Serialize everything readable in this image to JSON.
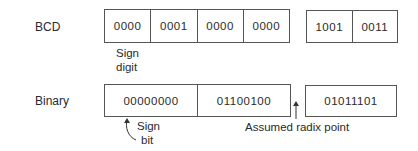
{
  "bcd": {
    "label": "BCD",
    "group1": [
      "0000",
      "0001",
      "0000",
      "0000"
    ],
    "group2": [
      "1001",
      "0011"
    ],
    "note_line1": "Sign",
    "note_line2": "digit"
  },
  "binary": {
    "label": "Binary",
    "group1": [
      "00000000",
      "01100100"
    ],
    "group2": [
      "01011101"
    ],
    "note_line1": "Sign",
    "note_line2": "bit",
    "radix_label": "Assumed radix point"
  }
}
